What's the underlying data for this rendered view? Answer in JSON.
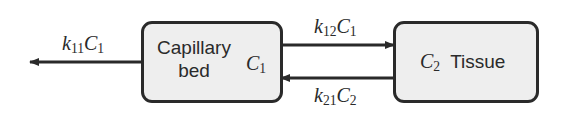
{
  "diagram": {
    "type": "two-compartment model",
    "colors": {
      "line": "#2a2a2a",
      "box_fill": "#eeeeee",
      "background": "#ffffff"
    },
    "nodes": [
      {
        "id": "capillary",
        "label_line1": "Capillary",
        "label_line2": "bed",
        "var": "C",
        "var_sub": "1"
      },
      {
        "id": "tissue",
        "label": "Tissue",
        "var": "C",
        "var_sub": "2"
      }
    ],
    "edges": [
      {
        "from": "capillary",
        "to": "out",
        "rate": "k",
        "rate_sub": "11",
        "conc": "C",
        "conc_sub": "1"
      },
      {
        "from": "capillary",
        "to": "tissue",
        "rate": "k",
        "rate_sub": "12",
        "conc": "C",
        "conc_sub": "1"
      },
      {
        "from": "tissue",
        "to": "capillary",
        "rate": "k",
        "rate_sub": "21",
        "conc": "C",
        "conc_sub": "2"
      }
    ]
  }
}
